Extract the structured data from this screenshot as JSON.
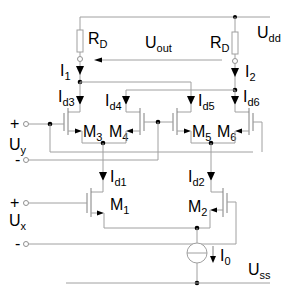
{
  "diagram": {
    "type": "circuit-schematic",
    "supply_top": {
      "label": "U",
      "sub": "dd"
    },
    "supply_bottom": {
      "label": "U",
      "sub": "ss"
    },
    "resistors": [
      {
        "label": "R",
        "sub": "D",
        "side": "left"
      },
      {
        "label": "R",
        "sub": "D",
        "side": "right"
      }
    ],
    "output": {
      "label": "U",
      "sub": "out"
    },
    "currents": {
      "i1": {
        "label": "I",
        "sub": "1"
      },
      "i2": {
        "label": "I",
        "sub": "2"
      },
      "id3": {
        "label": "I",
        "sub": "d3"
      },
      "id4": {
        "label": "I",
        "sub": "d4"
      },
      "id5": {
        "label": "I",
        "sub": "d5"
      },
      "id6": {
        "label": "I",
        "sub": "d6"
      },
      "id1": {
        "label": "I",
        "sub": "d1"
      },
      "id2": {
        "label": "I",
        "sub": "d2"
      },
      "i0": {
        "label": "I",
        "sub": "0"
      }
    },
    "transistors": {
      "m1": {
        "label": "M",
        "sub": "1"
      },
      "m2": {
        "label": "M",
        "sub": "2"
      },
      "m3": {
        "label": "M",
        "sub": "3"
      },
      "m4": {
        "label": "M",
        "sub": "4"
      },
      "m5": {
        "label": "M",
        "sub": "5"
      },
      "m6": {
        "label": "M",
        "sub": "6"
      }
    },
    "inputs": {
      "uy": {
        "label": "U",
        "sub": "y",
        "plus": "+",
        "minus": "-"
      },
      "ux": {
        "label": "U",
        "sub": "x",
        "plus": "+",
        "minus": "-"
      }
    }
  }
}
